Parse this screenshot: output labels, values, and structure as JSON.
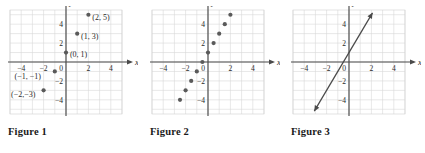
{
  "figures": [
    {
      "caption": "Figure 1",
      "axis": {
        "x_label": "x",
        "y_label": "y"
      },
      "ticks": {
        "x": [
          {
            "v": -4,
            "text": "−4"
          },
          {
            "v": -2,
            "text": "−2"
          },
          {
            "v": 2,
            "text": "2"
          },
          {
            "v": 4,
            "text": "4"
          }
        ],
        "y": [
          {
            "v": 4,
            "text": "4"
          },
          {
            "v": 2,
            "text": "2"
          },
          {
            "v": -2,
            "text": "−2"
          },
          {
            "v": -4,
            "text": "−4"
          }
        ],
        "origin_text": "0"
      },
      "points": [
        {
          "x": -2,
          "y": -3,
          "label": "(−2,−3)",
          "lx": -4.9,
          "ly": -3.75,
          "anchor": "start"
        },
        {
          "x": -1,
          "y": -1,
          "label": "(−1, −1)",
          "lx": -4.6,
          "ly": -1.85,
          "anchor": "start"
        },
        {
          "x": 0,
          "y": 1,
          "label": "(0, 1)",
          "lx": 0.35,
          "ly": 0.55,
          "anchor": "start"
        },
        {
          "x": 1,
          "y": 3,
          "label": "(1, 3)",
          "lx": 1.35,
          "ly": 2.45,
          "anchor": "start"
        },
        {
          "x": 2,
          "y": 5,
          "label": "(2, 5)",
          "lx": 2.35,
          "ly": 4.45,
          "anchor": "start"
        }
      ],
      "line": null
    },
    {
      "caption": "Figure 2",
      "axis": {
        "x_label": "x",
        "y_label": "y"
      },
      "ticks": {
        "x": [
          {
            "v": -4,
            "text": "−4"
          },
          {
            "v": -2,
            "text": "−2"
          },
          {
            "v": 2,
            "text": "2"
          },
          {
            "v": 4,
            "text": "4"
          }
        ],
        "y": [
          {
            "v": 4,
            "text": "4"
          },
          {
            "v": 2,
            "text": "2"
          },
          {
            "v": -2,
            "text": "−2"
          },
          {
            "v": -4,
            "text": "−4"
          }
        ],
        "origin_text": "0"
      },
      "points": [
        {
          "x": -2.5,
          "y": -4,
          "label": "",
          "lx": 0,
          "ly": 0,
          "anchor": "start"
        },
        {
          "x": -2,
          "y": -3,
          "label": "",
          "lx": 0,
          "ly": 0,
          "anchor": "start"
        },
        {
          "x": -1.5,
          "y": -2,
          "label": "",
          "lx": 0,
          "ly": 0,
          "anchor": "start"
        },
        {
          "x": -1,
          "y": -1,
          "label": "",
          "lx": 0,
          "ly": 0,
          "anchor": "start"
        },
        {
          "x": -0.5,
          "y": 0,
          "label": "",
          "lx": 0,
          "ly": 0,
          "anchor": "start"
        },
        {
          "x": 0,
          "y": 1,
          "label": "",
          "lx": 0,
          "ly": 0,
          "anchor": "start"
        },
        {
          "x": 0.5,
          "y": 2,
          "label": "",
          "lx": 0,
          "ly": 0,
          "anchor": "start"
        },
        {
          "x": 1,
          "y": 3,
          "label": "",
          "lx": 0,
          "ly": 0,
          "anchor": "start"
        },
        {
          "x": 1.5,
          "y": 4,
          "label": "",
          "lx": 0,
          "ly": 0,
          "anchor": "start"
        },
        {
          "x": 2,
          "y": 5,
          "label": "",
          "lx": 0,
          "ly": 0,
          "anchor": "start"
        }
      ],
      "line": null
    },
    {
      "caption": "Figure 3",
      "axis": {
        "x_label": "x",
        "y_label": "y"
      },
      "ticks": {
        "x": [
          {
            "v": -4,
            "text": "−4"
          },
          {
            "v": -2,
            "text": "−2"
          },
          {
            "v": 2,
            "text": "2"
          },
          {
            "v": 4,
            "text": "4"
          }
        ],
        "y": [
          {
            "v": 4,
            "text": "4"
          },
          {
            "v": 2,
            "text": "2"
          },
          {
            "v": -2,
            "text": "−2"
          },
          {
            "v": -4,
            "text": "−4"
          }
        ],
        "origin_text": "0"
      },
      "points": [],
      "line": {
        "x1": -3.1,
        "y1": -5.2,
        "x2": 2.1,
        "y2": 5.2,
        "arrows": "both"
      }
    }
  ],
  "chart_data": {
    "type": "scatter",
    "title": "",
    "xlabel": "x",
    "ylabel": "y",
    "xlim": [
      -5,
      5
    ],
    "ylim": [
      -5.5,
      5.5
    ],
    "grid": true,
    "relation": "y = 2x + 1",
    "series": [
      {
        "name": "Figure 1 integer points",
        "x": [
          -2,
          -1,
          0,
          1,
          2
        ],
        "y": [
          -3,
          -1,
          1,
          3,
          5
        ]
      },
      {
        "name": "Figure 2 half-unit points",
        "x": [
          -2.5,
          -2,
          -1.5,
          -1,
          -0.5,
          0,
          0.5,
          1,
          1.5,
          2
        ],
        "y": [
          -4,
          -3,
          -2,
          -1,
          0,
          1,
          2,
          3,
          4,
          5
        ]
      },
      {
        "name": "Figure 3 continuous line",
        "x": [
          -3.1,
          2.1
        ],
        "y": [
          -5.2,
          5.2
        ]
      }
    ]
  }
}
